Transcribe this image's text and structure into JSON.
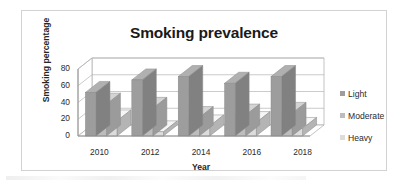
{
  "chart_data": {
    "type": "bar",
    "title": "Smoking prevalence",
    "xlabel": "Year",
    "ylabel": "Smoking percentage",
    "categories": [
      "2010",
      "2012",
      "2014",
      "2016",
      "2018"
    ],
    "series": [
      {
        "name": "Light",
        "values": [
          52,
          67,
          71,
          63,
          71
        ],
        "color": "#9d9d9d"
      },
      {
        "name": "Moderate",
        "values": [
          38,
          33,
          22,
          25,
          27
        ],
        "color": "#bdbdbd"
      },
      {
        "name": "Heavy",
        "values": [
          18,
          5,
          12,
          16,
          9
        ],
        "color": "#dcdcdc"
      }
    ],
    "ylim": [
      0,
      80
    ],
    "yticks": [
      "0",
      "20",
      "40",
      "60",
      "80"
    ],
    "grid": true,
    "legend_position": "right",
    "three_d": true
  },
  "frame": {
    "border_color": "#d2d2d2"
  }
}
